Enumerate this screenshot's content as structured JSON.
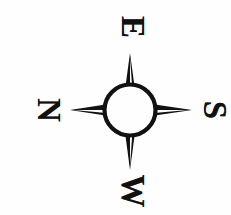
{
  "figure": {
    "kind": "compass-rose",
    "caption": "",
    "orientation_note": "figure printed sideways; labels rotated 90 degrees clockwise",
    "background_color": "#fefefe",
    "ink_color": "#111111"
  },
  "compass": {
    "center_x": 130,
    "center_y": 110,
    "circle_diameter": 55,
    "circle_stroke_width": 4,
    "points": [
      {
        "name": "north-point",
        "direction": "up",
        "tip_x": 130,
        "tip_y": 55
      },
      {
        "name": "east-point",
        "direction": "right",
        "tip_x": 190,
        "tip_y": 110
      },
      {
        "name": "south-point",
        "direction": "down",
        "tip_x": 130,
        "tip_y": 168
      },
      {
        "name": "west-point",
        "direction": "left",
        "tip_x": 72,
        "tip_y": 110
      }
    ]
  },
  "labels": {
    "top": {
      "text": "E",
      "cardinal": "east",
      "rotation_deg": 90
    },
    "right": {
      "text": "S",
      "cardinal": "south",
      "rotation_deg": 90
    },
    "bottom": {
      "text": "W",
      "cardinal": "west",
      "rotation_deg": 90
    },
    "left": {
      "text": "N",
      "cardinal": "north",
      "rotation_deg": 90
    }
  }
}
